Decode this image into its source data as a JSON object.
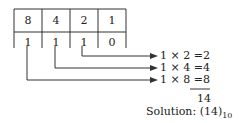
{
  "diagram": {
    "weights": [
      "8",
      "4",
      "2",
      "1"
    ],
    "bits": [
      "1",
      "1",
      "1",
      "0"
    ],
    "products": [
      {
        "expr": "1 × 2 =",
        "value": "2"
      },
      {
        "expr": "1 × 4 =",
        "value": "4"
      },
      {
        "expr": "1 × 8 =",
        "value": "8"
      }
    ],
    "sum": "14",
    "solution_label": "Solution:",
    "solution_value": "(14)",
    "solution_base": "10"
  }
}
